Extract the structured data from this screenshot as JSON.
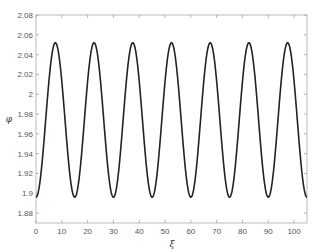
{
  "chart_data": {
    "type": "line",
    "title": "",
    "xlabel": "ξ",
    "ylabel": "φ",
    "xlim": [
      0,
      105
    ],
    "ylim": [
      1.87,
      2.08
    ],
    "grid": false,
    "legend": null,
    "x_ticks": [
      0,
      10,
      20,
      30,
      40,
      50,
      60,
      70,
      80,
      90,
      100
    ],
    "y_ticks": [
      1.88,
      1.9,
      1.92,
      1.94,
      1.96,
      1.98,
      2,
      2.02,
      2.04,
      2.06,
      2.08
    ],
    "y_tick_labels": [
      "1.88",
      "1.9",
      "1.92",
      "1.94",
      "1.96",
      "1.98",
      "2",
      "2.02",
      "2.04",
      "2.06",
      "2.08"
    ],
    "series": [
      {
        "name": "phi",
        "color": "#222222",
        "description": "periodic oscillation, period ~15, min ~1.896, max ~2.052",
        "x": [
          0,
          7.5,
          15,
          22.5,
          30,
          37.5,
          45,
          52.5,
          60,
          67.5,
          75,
          82.5,
          90,
          97.5,
          105
        ],
        "values": [
          1.896,
          2.052,
          1.896,
          2.052,
          1.896,
          2.052,
          1.896,
          2.051,
          1.896,
          2.051,
          1.896,
          2.051,
          1.896,
          2.051,
          1.895
        ]
      }
    ],
    "model": {
      "mean": 1.974,
      "amplitude": 0.078,
      "period": 15,
      "first_peak": 7.5
    }
  },
  "plot": {
    "left": 36,
    "right": 307,
    "top": 15,
    "bottom": 223,
    "x_px_per_unit": 2.58,
    "y_px_per_0_02": 19.8
  }
}
